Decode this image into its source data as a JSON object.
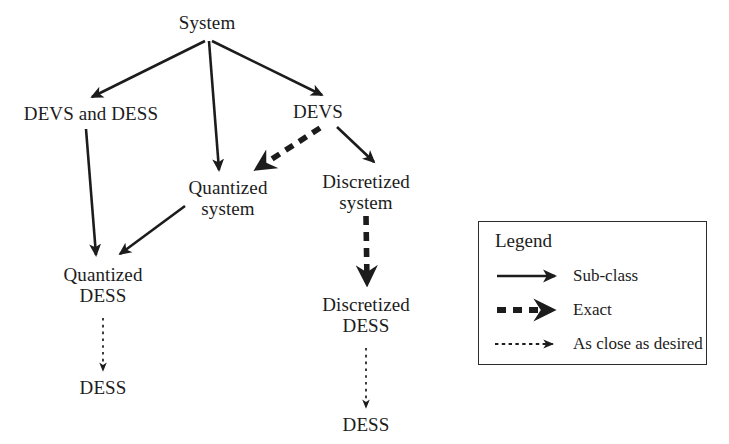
{
  "diagram": {
    "colors": {
      "stroke": "#1c1c1c",
      "text": "#1c1c1c",
      "background": "#ffffff",
      "legend_border": "#2b2b2b"
    },
    "nodes": [
      {
        "id": "system",
        "label": "System",
        "x": 207,
        "y": 12
      },
      {
        "id": "devs-and-dess",
        "label": "DEVS and DESS",
        "x": 91,
        "y": 103
      },
      {
        "id": "devs",
        "label": "DEVS",
        "x": 318,
        "y": 101
      },
      {
        "id": "quantized-system",
        "label": "Quantized\nsystem",
        "x": 228,
        "y": 177
      },
      {
        "id": "discretized-system",
        "label": "Discretized\nsystem",
        "x": 366,
        "y": 171
      },
      {
        "id": "quantized-dess",
        "label": "Quantized\nDESS",
        "x": 103,
        "y": 264
      },
      {
        "id": "discretized-dess",
        "label": "Discretized\nDESS",
        "x": 366,
        "y": 294
      },
      {
        "id": "dess-left",
        "label": "DESS",
        "x": 103,
        "y": 377
      },
      {
        "id": "dess-right",
        "label": "DESS",
        "x": 366,
        "y": 414
      }
    ],
    "edges": [
      {
        "id": "system-to-devs-and-dess",
        "from": "system",
        "to": "devs-and-dess",
        "type": "sub-class"
      },
      {
        "id": "system-to-quantized-system",
        "from": "system",
        "to": "quantized-system",
        "type": "sub-class"
      },
      {
        "id": "system-to-devs",
        "from": "system",
        "to": "devs",
        "type": "sub-class"
      },
      {
        "id": "devs-to-quantized-system",
        "from": "devs",
        "to": "quantized-system",
        "type": "exact"
      },
      {
        "id": "devs-to-discretized-system",
        "from": "devs",
        "to": "discretized-system",
        "type": "sub-class"
      },
      {
        "id": "devs-and-dess-to-quantized-dess",
        "from": "devs-and-dess",
        "to": "quantized-dess",
        "type": "sub-class"
      },
      {
        "id": "quantized-system-to-quantized-dess",
        "from": "quantized-system",
        "to": "quantized-dess",
        "type": "sub-class"
      },
      {
        "id": "quantized-dess-to-dess",
        "from": "quantized-dess",
        "to": "dess-left",
        "type": "as-close-as-desired"
      },
      {
        "id": "discretized-system-to-discretized-dess",
        "from": "discretized-system",
        "to": "discretized-dess",
        "type": "exact"
      },
      {
        "id": "discretized-dess-to-dess",
        "from": "discretized-dess",
        "to": "dess-right",
        "type": "as-close-as-desired"
      }
    ]
  },
  "legend": {
    "title": "Legend",
    "items": [
      {
        "id": "sub-class",
        "label": "Sub-class",
        "style": "solid-arrow"
      },
      {
        "id": "exact",
        "label": "Exact",
        "style": "thick-dashed-arrow"
      },
      {
        "id": "as-close-as-desired",
        "label": "As close as desired",
        "style": "thin-dotted-arrow"
      }
    ]
  }
}
